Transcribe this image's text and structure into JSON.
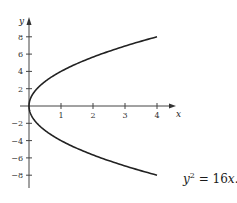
{
  "chart_data": {
    "type": "line",
    "title": "",
    "xlabel": "x",
    "ylabel": "y",
    "annotation": "y^2 = 16x.",
    "equation": {
      "lhs_var": "y",
      "lhs_exp": "2",
      "rhs": "= 16",
      "rhs_var": "x",
      "trail": "."
    },
    "xlim": [
      0,
      4.5
    ],
    "ylim": [
      -9,
      9.5
    ],
    "x_ticks": [
      1,
      2,
      3,
      4
    ],
    "x_tick_labels": [
      "1",
      "2",
      "3",
      "4"
    ],
    "y_ticks": [
      8,
      6,
      4,
      2,
      -2,
      -4,
      -6,
      -8
    ],
    "y_tick_labels": [
      "8",
      "6",
      "4",
      "2",
      "−2",
      "−4",
      "−6",
      "−8"
    ],
    "grid": false,
    "legend": null,
    "series": [
      {
        "name": "y^2 = 16x",
        "description": "Parabola opening to the right, vertex at origin",
        "x": [
          4,
          3,
          2.25,
          1.5625,
          1,
          0.5625,
          0.25,
          0.0625,
          0,
          0.0625,
          0.25,
          0.5625,
          1,
          1.5625,
          2.25,
          3,
          4
        ],
        "y": [
          8,
          6.928,
          6,
          5,
          4,
          3,
          2,
          1,
          0,
          -1,
          -2,
          -3,
          -4,
          -5,
          -6,
          -6.928,
          -8
        ],
        "color": "#222222"
      }
    ]
  }
}
